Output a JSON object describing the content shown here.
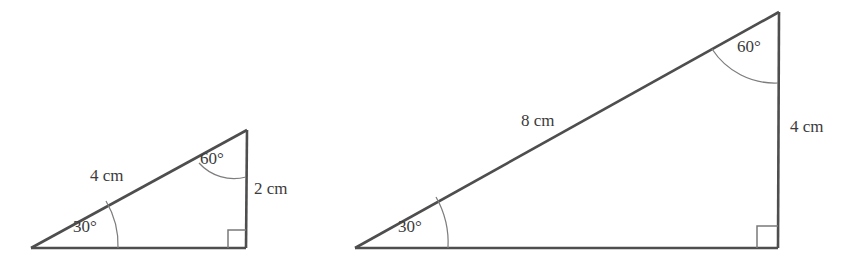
{
  "figure": {
    "background_color": "#ffffff",
    "line_color": "#4e4e4e",
    "arc_color": "#7d7d7d",
    "text_color": "#3b3b3b",
    "triangles": [
      {
        "id": "small-triangle",
        "name": "small-right-triangle",
        "vertices": {
          "left": [
            31,
            248
          ],
          "right_angle": [
            246,
            248
          ],
          "top": [
            247,
            130
          ]
        },
        "labels": {
          "hypotenuse": "4 cm",
          "vertical_side": "2 cm",
          "top_angle": "60°",
          "left_angle": "30°"
        }
      },
      {
        "id": "large-triangle",
        "name": "large-right-triangle",
        "vertices": {
          "left": [
            355,
            248
          ],
          "right_angle": [
            778,
            248
          ],
          "top": [
            779,
            12
          ]
        },
        "labels": {
          "hypotenuse": "8 cm",
          "vertical_side": "4 cm",
          "top_angle": "60°",
          "left_angle": "30°"
        }
      }
    ]
  }
}
